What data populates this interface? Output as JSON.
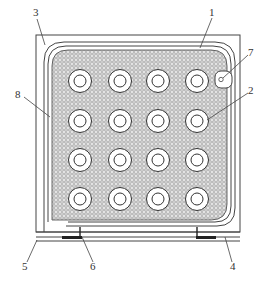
{
  "diagram": {
    "type": "technical-drawing",
    "colors": {
      "background": "#ffffff",
      "line": "#444444",
      "mesh": "#bdbdbd"
    },
    "grid": {
      "rows": 4,
      "cols": 4,
      "col_centers": [
        80,
        120,
        158,
        197
      ],
      "row_centers": [
        81,
        121,
        160,
        199
      ]
    },
    "labels": [
      {
        "id": "1",
        "text": "1"
      },
      {
        "id": "2",
        "text": "2"
      },
      {
        "id": "3",
        "text": "3"
      },
      {
        "id": "4",
        "text": "4"
      },
      {
        "id": "5",
        "text": "5"
      },
      {
        "id": "6",
        "text": "6"
      },
      {
        "id": "7",
        "text": "7"
      },
      {
        "id": "8",
        "text": "8"
      }
    ]
  }
}
